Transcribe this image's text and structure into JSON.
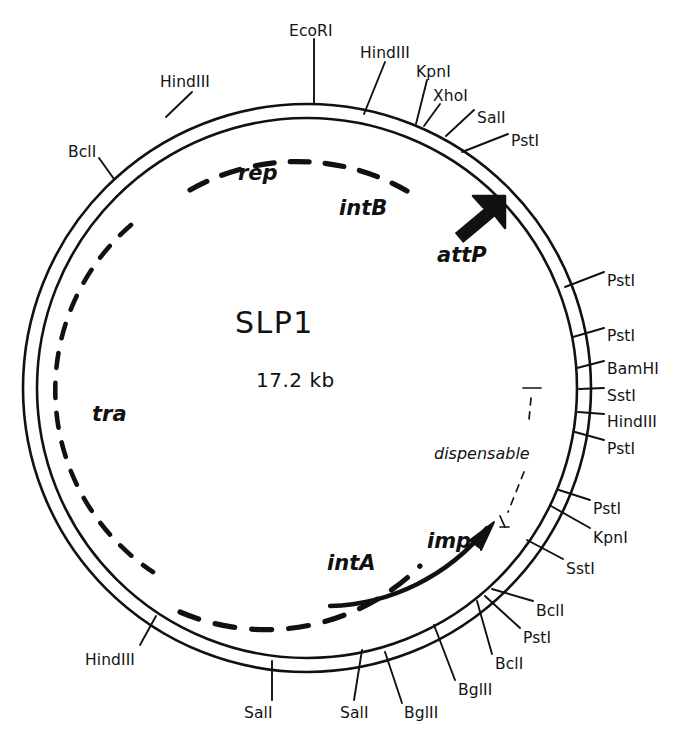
{
  "figure": {
    "kind": "plasmid-map",
    "name": "SLP1",
    "size": "17.2 kb",
    "background": "#ffffff",
    "ink": "#111111"
  },
  "center": {
    "title": "SLP1",
    "subtitle": "17.2 kb"
  },
  "genes": [
    {
      "id": "rep",
      "label": "rep",
      "x": 238,
      "y": 163,
      "style": "big"
    },
    {
      "id": "intB",
      "label": "intB",
      "x": 339,
      "y": 198,
      "style": "big"
    },
    {
      "id": "attP",
      "label": "attP",
      "x": 437,
      "y": 245,
      "style": "big"
    },
    {
      "id": "tra",
      "label": "tra",
      "x": 92,
      "y": 404,
      "style": "big"
    },
    {
      "id": "intA",
      "label": "intA",
      "x": 327,
      "y": 553,
      "style": "big"
    },
    {
      "id": "imp",
      "label": "imp",
      "x": 427,
      "y": 531,
      "style": "big"
    },
    {
      "id": "dispensable",
      "label": "dispensable",
      "x": 434,
      "y": 446,
      "style": "small"
    }
  ],
  "sites": [
    {
      "id": "s1",
      "label": "HindIII",
      "x": 160,
      "y": 75,
      "anchor": "start"
    },
    {
      "id": "s2",
      "label": "EcoRI",
      "x": 289,
      "y": 24,
      "anchor": "start"
    },
    {
      "id": "s3",
      "label": "HindIII",
      "x": 360,
      "y": 46,
      "anchor": "start"
    },
    {
      "id": "s4",
      "label": "KpnI",
      "x": 416,
      "y": 65,
      "anchor": "start"
    },
    {
      "id": "s5",
      "label": "XhoI",
      "x": 433,
      "y": 89,
      "anchor": "start"
    },
    {
      "id": "s6",
      "label": "SalI",
      "x": 477,
      "y": 111,
      "anchor": "start"
    },
    {
      "id": "s7",
      "label": "PstI",
      "x": 511,
      "y": 134,
      "anchor": "start"
    },
    {
      "id": "s8",
      "label": "BclI",
      "x": 68,
      "y": 145,
      "anchor": "start"
    },
    {
      "id": "s9",
      "label": "PstI",
      "x": 607,
      "y": 274,
      "anchor": "start"
    },
    {
      "id": "s10",
      "label": "PstI",
      "x": 607,
      "y": 329,
      "anchor": "start"
    },
    {
      "id": "s11",
      "label": "BamHI",
      "x": 607,
      "y": 362,
      "anchor": "start"
    },
    {
      "id": "s12",
      "label": "SstI",
      "x": 607,
      "y": 389,
      "anchor": "start"
    },
    {
      "id": "s13",
      "label": "HindIII",
      "x": 607,
      "y": 415,
      "anchor": "start"
    },
    {
      "id": "s14",
      "label": "PstI",
      "x": 607,
      "y": 442,
      "anchor": "start"
    },
    {
      "id": "s15",
      "label": "PstI",
      "x": 593,
      "y": 502,
      "anchor": "start"
    },
    {
      "id": "s16",
      "label": "KpnI",
      "x": 593,
      "y": 531,
      "anchor": "start"
    },
    {
      "id": "s17",
      "label": "SstI",
      "x": 566,
      "y": 562,
      "anchor": "start"
    },
    {
      "id": "s18",
      "label": "BclI",
      "x": 536,
      "y": 604,
      "anchor": "start"
    },
    {
      "id": "s19",
      "label": "PstI",
      "x": 523,
      "y": 631,
      "anchor": "start"
    },
    {
      "id": "s20",
      "label": "BclI",
      "x": 495,
      "y": 657,
      "anchor": "start"
    },
    {
      "id": "s21",
      "label": "BglII",
      "x": 458,
      "y": 683,
      "anchor": "start"
    },
    {
      "id": "s22",
      "label": "BglII",
      "x": 404,
      "y": 706,
      "anchor": "start"
    },
    {
      "id": "s23",
      "label": "SalI",
      "x": 340,
      "y": 706,
      "anchor": "start"
    },
    {
      "id": "s24",
      "label": "SalI",
      "x": 244,
      "y": 706,
      "anchor": "start"
    },
    {
      "id": "s25",
      "label": "HindIII",
      "x": 85,
      "y": 653,
      "anchor": "start"
    }
  ],
  "leader_lines": [
    {
      "id": "l1",
      "x1": 192,
      "y1": 92,
      "x2": 166,
      "y2": 117
    },
    {
      "id": "l2",
      "x1": 314,
      "y1": 39,
      "x2": 314,
      "y2": 103
    },
    {
      "id": "l3",
      "x1": 385,
      "y1": 62,
      "x2": 364,
      "y2": 114
    },
    {
      "id": "l4",
      "x1": 427,
      "y1": 80,
      "x2": 416,
      "y2": 124
    },
    {
      "id": "l5",
      "x1": 440,
      "y1": 104,
      "x2": 424,
      "y2": 126
    },
    {
      "id": "l6",
      "x1": 474,
      "y1": 110,
      "x2": 446,
      "y2": 136
    },
    {
      "id": "l7",
      "x1": 508,
      "y1": 134,
      "x2": 462,
      "y2": 152
    },
    {
      "id": "l8",
      "x1": 99,
      "y1": 158,
      "x2": 114,
      "y2": 179
    },
    {
      "id": "l9",
      "x1": 604,
      "y1": 272,
      "x2": 565,
      "y2": 287
    },
    {
      "id": "l10",
      "x1": 604,
      "y1": 328,
      "x2": 573,
      "y2": 337
    },
    {
      "id": "l11",
      "x1": 604,
      "y1": 361,
      "x2": 577,
      "y2": 368
    },
    {
      "id": "l12",
      "x1": 604,
      "y1": 388,
      "x2": 579,
      "y2": 389
    },
    {
      "id": "l13",
      "x1": 604,
      "y1": 414,
      "x2": 578,
      "y2": 412
    },
    {
      "id": "l14",
      "x1": 604,
      "y1": 440,
      "x2": 575,
      "y2": 432
    },
    {
      "id": "l15",
      "x1": 590,
      "y1": 500,
      "x2": 559,
      "y2": 490
    },
    {
      "id": "l16",
      "x1": 590,
      "y1": 528,
      "x2": 551,
      "y2": 506
    },
    {
      "id": "l17",
      "x1": 563,
      "y1": 559,
      "x2": 527,
      "y2": 540
    },
    {
      "id": "l18",
      "x1": 533,
      "y1": 601,
      "x2": 492,
      "y2": 589
    },
    {
      "id": "l19",
      "x1": 520,
      "y1": 628,
      "x2": 485,
      "y2": 596
    },
    {
      "id": "l20",
      "x1": 492,
      "y1": 654,
      "x2": 477,
      "y2": 601
    },
    {
      "id": "l21",
      "x1": 455,
      "y1": 680,
      "x2": 434,
      "y2": 625
    },
    {
      "id": "l22",
      "x1": 402,
      "y1": 703,
      "x2": 385,
      "y2": 652
    },
    {
      "id": "l23",
      "x1": 354,
      "y1": 700,
      "x2": 362,
      "y2": 650
    },
    {
      "id": "l24",
      "x1": 272,
      "y1": 700,
      "x2": 272,
      "y2": 661
    },
    {
      "id": "l25",
      "x1": 140,
      "y1": 645,
      "x2": 156,
      "y2": 616
    }
  ],
  "arcs": {
    "rep_intB": {
      "note": "dashed arc, upper interior"
    },
    "tra": {
      "note": "dashed arc, left interior"
    },
    "intA": {
      "note": "dashed arc, lower interior"
    },
    "imp": {
      "note": "solid arc with arrowhead, lower right interior"
    },
    "attP": {
      "note": "thick solid arrow, upper right interior"
    },
    "dispensable": {
      "note": "dashed bracket with T ends, right interior"
    }
  },
  "colors": {
    "ink": "#111111",
    "page": "#ffffff"
  }
}
